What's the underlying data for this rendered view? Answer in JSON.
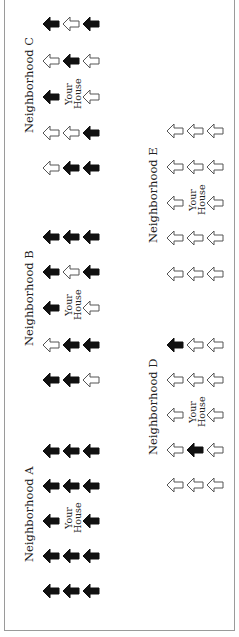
{
  "diagram": {
    "orientation": "rotated-90-ccw",
    "your_house_label": [
      "Your",
      "House"
    ],
    "legend_meaning": {
      "black": "filled arrow",
      "white": "outline arrow"
    },
    "colors": {
      "filled": "#111111",
      "outline_stroke": "#555555",
      "outline_fill": "#ffffff",
      "frame": "#9a9a9a"
    },
    "neighborhoods": [
      {
        "name": "Neighborhood A",
        "label_pos": {
          "x": 24,
          "y": 562
        },
        "cols_x": [
          42,
          62,
          82
        ],
        "rows_y": [
          442,
          477,
          512,
          547,
          582
        ],
        "grid": [
          [
            "black",
            "black",
            "black"
          ],
          [
            "black",
            "black",
            "black"
          ],
          [
            "black",
            "house",
            "black"
          ],
          [
            "black",
            "black",
            "black"
          ],
          [
            "black",
            "black",
            "black"
          ]
        ]
      },
      {
        "name": "Neighborhood B",
        "label_pos": {
          "x": 24,
          "y": 346
        },
        "cols_x": [
          42,
          62,
          82
        ],
        "rows_y": [
          228,
          263,
          299,
          336,
          371
        ],
        "grid": [
          [
            "black",
            "black",
            "black"
          ],
          [
            "black",
            "white",
            "black"
          ],
          [
            "black",
            "house",
            "white"
          ],
          [
            "white",
            "black",
            "black"
          ],
          [
            "black",
            "black",
            "white"
          ]
        ]
      },
      {
        "name": "Neighborhood C",
        "label_pos": {
          "x": 24,
          "y": 133
        },
        "cols_x": [
          42,
          62,
          82
        ],
        "rows_y": [
          15,
          52,
          88,
          124,
          159
        ],
        "grid": [
          [
            "black",
            "white",
            "black"
          ],
          [
            "white",
            "black",
            "white"
          ],
          [
            "black",
            "house",
            "white"
          ],
          [
            "white",
            "white",
            "black"
          ],
          [
            "white",
            "black",
            "black"
          ]
        ]
      },
      {
        "name": "Neighborhood D",
        "label_pos": {
          "x": 148,
          "y": 455
        },
        "cols_x": [
          166,
          186,
          206
        ],
        "rows_y": [
          336,
          371,
          406,
          441,
          476
        ],
        "grid": [
          [
            "black",
            "white",
            "white"
          ],
          [
            "white",
            "white",
            "white"
          ],
          [
            "white",
            "house",
            "white"
          ],
          [
            "white",
            "black",
            "white"
          ],
          [
            "white",
            "white",
            "white"
          ]
        ]
      },
      {
        "name": "Neighborhood E",
        "label_pos": {
          "x": 148,
          "y": 243
        },
        "cols_x": [
          166,
          186,
          206
        ],
        "rows_y": [
          122,
          158,
          194,
          229,
          265
        ],
        "grid": [
          [
            "white",
            "white",
            "white"
          ],
          [
            "white",
            "white",
            "white"
          ],
          [
            "white",
            "house",
            "white"
          ],
          [
            "white",
            "white",
            "white"
          ],
          [
            "white",
            "white",
            "white"
          ]
        ]
      }
    ]
  }
}
